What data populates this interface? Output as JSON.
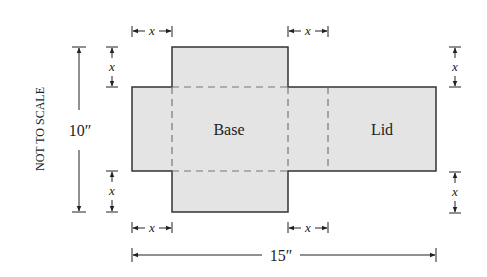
{
  "diagram": {
    "type": "box-net",
    "colors": {
      "fill": "#e4e4e4",
      "stroke": "#333333",
      "dash": "#777777",
      "text": "#222222",
      "background": "#ffffff"
    },
    "panels": {
      "base_label": "Base",
      "lid_label": "Lid"
    },
    "dimensions": {
      "height_label": "10″",
      "width_label": "15″",
      "flap_label": "x"
    },
    "note": "NOT TO SCALE"
  }
}
